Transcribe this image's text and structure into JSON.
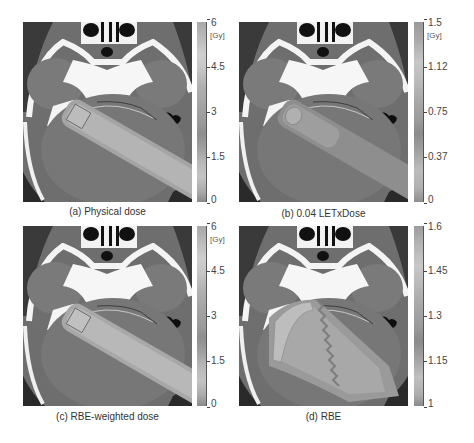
{
  "figure": {
    "panels": [
      {
        "id": "a",
        "caption": "(a) Physical dose",
        "colorbar": {
          "unit": "[Gy]",
          "ticks": [
            "6",
            "4.5",
            "3",
            "1.5",
            "0"
          ],
          "min": 0,
          "max": 6
        }
      },
      {
        "id": "b",
        "caption": "(b) 0.04 LETxDose",
        "colorbar": {
          "unit": "[Gy]",
          "ticks": [
            "1.5",
            "1.12",
            "0.75",
            "0.37",
            "0"
          ],
          "min": 0,
          "max": 1.5
        }
      },
      {
        "id": "c",
        "caption": "(c) RBE-weighted dose",
        "colorbar": {
          "unit": "[Gy]",
          "ticks": [
            "6",
            "4.5",
            "3",
            "1.5",
            "0"
          ],
          "min": 0,
          "max": 6
        }
      },
      {
        "id": "d",
        "caption": "(d) RBE",
        "colorbar": {
          "unit": "",
          "ticks": [
            "1.6",
            "1.45",
            "1.3",
            "1.15",
            "1"
          ],
          "min": 1,
          "max": 1.6
        }
      }
    ],
    "image_description": "Axial CT slices of the head with overlaid proton beam dose/LET/RBE maps (grayscale)"
  }
}
